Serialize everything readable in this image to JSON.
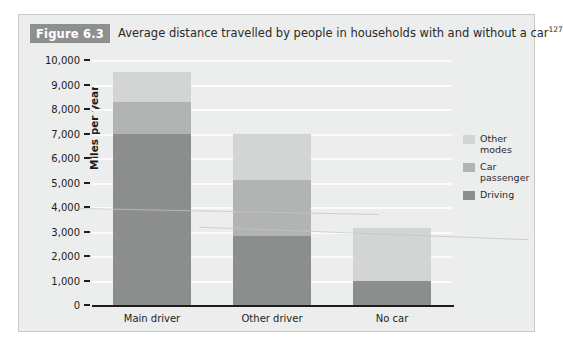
{
  "figure": {
    "badge": "Figure 6.3",
    "title": "Average distance travelled by people in households with and without a car",
    "title_superscript": "127"
  },
  "chart_data": {
    "type": "bar",
    "subtype": "stacked",
    "title": "Average distance travelled by people in households with and without a car",
    "xlabel": "",
    "ylabel": "Miles per year",
    "ylim": [
      0,
      10000
    ],
    "ytick_step": 1000,
    "ytick_labels": [
      "10,000",
      "9,000",
      "8,000",
      "7,000",
      "6,000",
      "5,000",
      "4,000",
      "3,000",
      "2,000",
      "1,000",
      "0"
    ],
    "ytick_values": [
      10000,
      9000,
      8000,
      7000,
      6000,
      5000,
      4000,
      3000,
      2000,
      1000,
      0
    ],
    "grid": true,
    "legend_position": "right",
    "categories": [
      "Main driver",
      "Other driver",
      "No car"
    ],
    "series": [
      {
        "name": "Driving",
        "color": "#8c8d8d",
        "values": [
          7000,
          2800,
          1000
        ]
      },
      {
        "name": "Car passenger",
        "color": "#b2b3b3",
        "values": [
          1300,
          2300,
          0
        ]
      },
      {
        "name": "Other modes",
        "color": "#d3d4d4",
        "values": [
          1200,
          1900,
          2150
        ]
      }
    ],
    "totals": [
      9500,
      7000,
      3150
    ]
  },
  "legend": {
    "entries": [
      {
        "label_line1": "Other",
        "label_line2": "modes",
        "color": "#d3d4d4"
      },
      {
        "label_line1": "Car",
        "label_line2": "passenger",
        "color": "#b2b3b3"
      },
      {
        "label_line1": "Driving",
        "label_line2": "",
        "color": "#8c8d8d"
      }
    ]
  },
  "colors": {
    "panel_background": "#eceded",
    "panel_border": "#c9cbcb",
    "badge_background": "#8e8f8f",
    "badge_text": "#ffffff",
    "gridline": "#fbfbfb",
    "axis": "#1d1d1d",
    "text": "#1d1d1d"
  }
}
